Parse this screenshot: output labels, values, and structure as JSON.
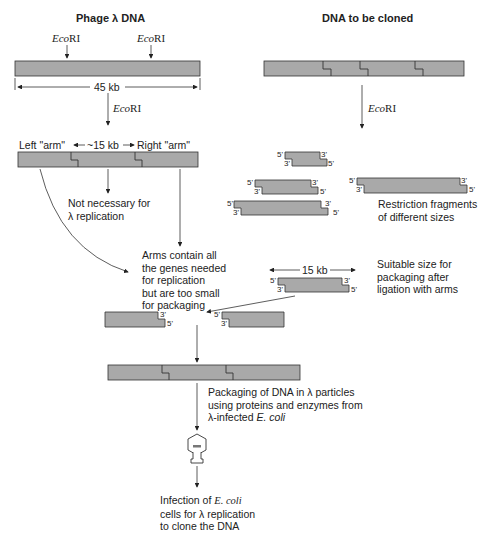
{
  "titles": {
    "left": "Phage λ DNA",
    "right": "DNA to be cloned"
  },
  "enzyme": {
    "italic": "Eco",
    "roman": "RI"
  },
  "phage": {
    "length_label": "45 kb",
    "left_arm": "Left \"arm\"",
    "middle": "~15 kb",
    "right_arm": "Right \"arm\""
  },
  "notes": {
    "not_necessary_1": "Not necessary for",
    "not_necessary_2": "λ replication",
    "arms_1": "Arms contain all",
    "arms_2": "the genes needed",
    "arms_3": "for replication",
    "arms_4": "but are too small",
    "arms_5": "for packaging",
    "fragments_1": "Restriction fragments",
    "fragments_2": "of different sizes",
    "insert_size": "15 kb",
    "suitable_1": "Suitable size for",
    "suitable_2": "packaging after",
    "suitable_3": "ligation with arms",
    "packaging_1": "Packaging of DNA in λ particles",
    "packaging_2": "using proteins and enzymes from",
    "packaging_3_pre": "λ-infected ",
    "packaging_3_it": "E. coli",
    "infection_1_pre": "Infection of ",
    "infection_1_it": "E. coli",
    "infection_2": "cells for λ replication",
    "infection_3": "to clone the DNA"
  },
  "ends": {
    "five": "5'",
    "three": "3'"
  },
  "colors": {
    "dna_fill": "#a9a9a9",
    "stroke": "#333333"
  }
}
